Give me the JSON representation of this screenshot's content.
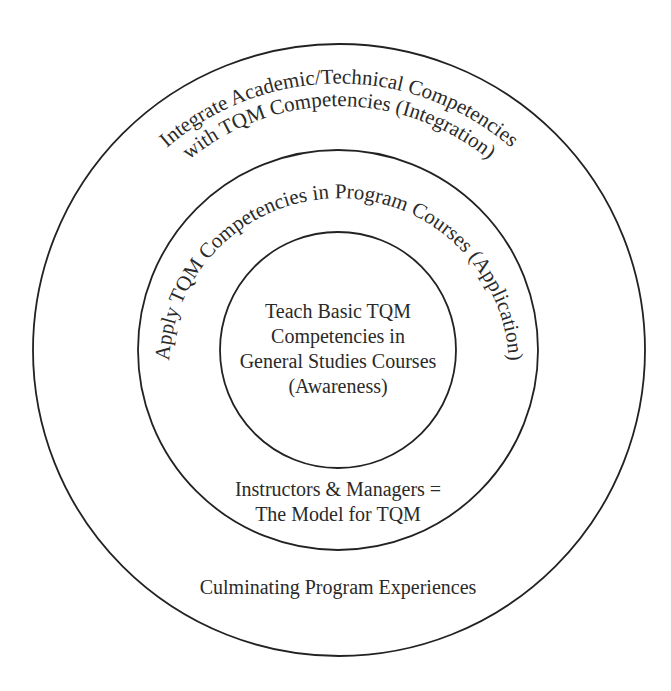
{
  "diagram": {
    "type": "concentric-circles",
    "colors": {
      "stroke": "#222222",
      "text": "#2a2a2a",
      "background": "#ffffff"
    },
    "outer_ring": {
      "arc_line_1": "Integrate Academic/Technical Competencies",
      "arc_line_2": "with TQM Competencies (Integration)",
      "bottom_label": "Culminating Program Experiences"
    },
    "middle_ring": {
      "arc_line": "Apply TQM Competencies in Program Courses (Application)",
      "bottom_line_1": "Instructors & Managers =",
      "bottom_line_2": "The Model for TQM"
    },
    "inner_circle": {
      "line_1": "Teach Basic TQM",
      "line_2": "Competencies in",
      "line_3": "General Studies Courses",
      "line_4": "(Awareness)"
    }
  }
}
